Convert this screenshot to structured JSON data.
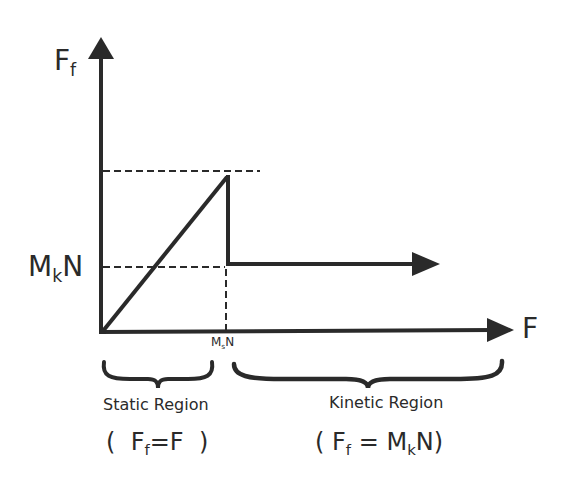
{
  "diagram": {
    "axes": {
      "y_label_main": "F",
      "y_label_sub": "f",
      "x_label": "F"
    },
    "ticks": {
      "y_kinetic_main": "M",
      "y_kinetic_sub": "k",
      "y_kinetic_tail": "N",
      "x_static_main": "M",
      "x_static_sub": "s",
      "x_static_tail": "N"
    },
    "regions": [
      {
        "name": "Static Region",
        "eq_open": "(",
        "eq_lhs_main": "F",
        "eq_lhs_sub": "f",
        "eq_equals": "=",
        "eq_rhs": "F",
        "eq_close": ")"
      },
      {
        "name": "Kinetic Region",
        "eq_open": "(",
        "eq_lhs_main": "F",
        "eq_lhs_sub": "f",
        "eq_equals": "=",
        "eq_rhs_main": "M",
        "eq_rhs_sub": "k",
        "eq_rhs_tail": "N",
        "eq_close": ")"
      }
    ],
    "colors": {
      "ink": "#2a2a2a",
      "background": "#ffffff"
    }
  }
}
